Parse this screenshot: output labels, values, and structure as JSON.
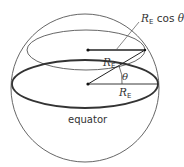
{
  "diagram": {
    "type": "geometry",
    "labels": {
      "top_right": {
        "symbol": "R",
        "subscript": "E",
        "suffix": " cos ",
        "angle": "θ"
      },
      "slanted_radius": {
        "symbol": "R",
        "subscript": "E"
      },
      "angle": "θ",
      "equator_radius": {
        "symbol": "R",
        "subscript": "E"
      },
      "equator": "equator"
    },
    "colors": {
      "stroke": "#4a4a4a",
      "thick_stroke": "#333333",
      "text": "#333333",
      "background": "#ffffff"
    }
  }
}
